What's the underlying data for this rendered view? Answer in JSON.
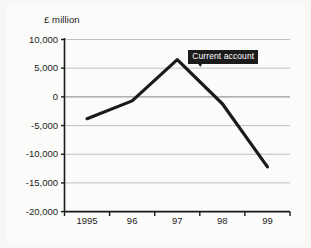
{
  "chart_data": {
    "type": "line",
    "title": "",
    "subtitle": "",
    "ylabel": "£ million",
    "xlabel": "",
    "grid": true,
    "legend_position": "none",
    "x": [
      "1995",
      "96",
      "97",
      "98",
      "99"
    ],
    "xtick_labels": [
      "1995",
      "96",
      "97",
      "98",
      "99"
    ],
    "ytick_labels": [
      "10,000",
      "5,000",
      "0",
      "-5,000",
      "-10,000",
      "-15,000",
      "-20,000"
    ],
    "ytick_values": [
      10000,
      5000,
      0,
      -5000,
      -10000,
      -15000,
      -20000
    ],
    "ylim": [
      -20000,
      10000
    ],
    "series": [
      {
        "name": "Current account",
        "color": "#1a1a1a",
        "values": [
          -3800,
          -700,
          6500,
          -1200,
          -12200
        ]
      }
    ],
    "annotations": [
      {
        "text": "Current account",
        "target_x": "97",
        "target_value": 5200,
        "box_color": "#1c1c1c",
        "text_color": "#ffffff"
      }
    ],
    "colors": {
      "line": "#1a1a1a",
      "grid": "#b9b9b9",
      "axis": "#1a1a1a",
      "background": "#fbfbfa",
      "text": "#1b1b1b"
    }
  }
}
